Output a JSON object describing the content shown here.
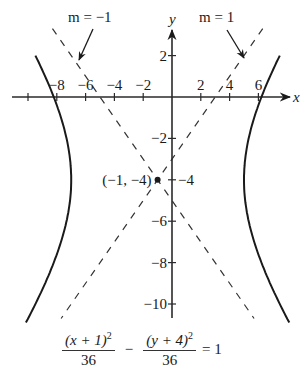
{
  "figure": {
    "type": "hyperbola-graph",
    "center": {
      "x": -1,
      "y": -4,
      "label": "(−1, −4)"
    },
    "a_squared": 36,
    "b_squared": 36,
    "orientation": "horizontal",
    "vertices": [
      {
        "x": -7,
        "y": -4
      },
      {
        "x": 5,
        "y": -4
      }
    ],
    "asymptotes": [
      {
        "slope": -1,
        "label": "m = −1",
        "equation": "y + 4 = −(x + 1)"
      },
      {
        "slope": 1,
        "label": "m = 1",
        "equation": "y + 4 = x + 1"
      }
    ],
    "colors": {
      "curve": "#1a1a1a",
      "axes": "#2a2a2a",
      "asymptote": "#333333",
      "background": "#ffffff"
    }
  },
  "axes": {
    "x_label": "x",
    "y_label": "y",
    "x_ticks": [
      {
        "value": -10,
        "label": ""
      },
      {
        "value": -8,
        "label": "−8"
      },
      {
        "value": -6,
        "label": "−6"
      },
      {
        "value": -4,
        "label": "−4"
      },
      {
        "value": -2,
        "label": "−2"
      },
      {
        "value": 2,
        "label": "2"
      },
      {
        "value": 4,
        "label": "4"
      },
      {
        "value": 6,
        "label": "6"
      }
    ],
    "y_ticks": [
      {
        "value": 2,
        "label": "2"
      },
      {
        "value": -2,
        "label": "−2"
      },
      {
        "value": -4,
        "label": "−4"
      },
      {
        "value": -6,
        "label": "−6"
      },
      {
        "value": -8,
        "label": "−8"
      },
      {
        "value": -10,
        "label": "−10"
      }
    ],
    "x_range": [
      -10.5,
      7.8
    ],
    "y_range": [
      -10.8,
      3.4
    ]
  },
  "annotations": {
    "slope_left": "m = −1",
    "slope_right": "m = 1",
    "center_label": "(−1, −4)"
  },
  "equation": {
    "term1_numerator_base": "(x + 1)",
    "term1_exponent": "2",
    "term1_denominator": "36",
    "operator": "−",
    "term2_numerator_base": "(y + 4)",
    "term2_exponent": "2",
    "term2_denominator": "36",
    "rhs": "= 1"
  }
}
